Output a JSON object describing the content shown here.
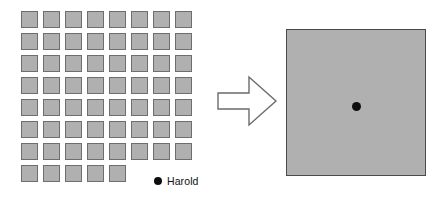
{
  "figure": {
    "background_color": "#ffffff"
  },
  "left_panel": {
    "name": "individual-cells-grid",
    "description": "Grid of individual gray unit squares representing separate records",
    "columns": 8,
    "rows": 8,
    "cell_count": 61,
    "last_row_cell_count": 5,
    "cell_fill_color": "#b0b0b0",
    "cell_border_color": "#6e6e6e",
    "cell_size_px": 17,
    "cell_gap_px": 5
  },
  "legend": {
    "name": "harold-legend",
    "marker": "filled-circle",
    "marker_color": "#0d0d0d",
    "label": "Harold"
  },
  "arrow": {
    "name": "transformation-arrow",
    "direction": "right",
    "style": "outlined-block-arrow",
    "stroke_color": "#6b6b6b",
    "fill_color": "#ffffff"
  },
  "right_panel": {
    "name": "aggregated-area",
    "description": "Single large gray square representing the aggregated area",
    "fill_color": "#b0b0b0",
    "border_color": "#4a4a4a",
    "marker": {
      "name": "harold-point",
      "color": "#0d0d0d",
      "label": "Harold"
    }
  },
  "chart_data": {
    "type": "diagram",
    "left": {
      "label": "Individual cells",
      "cell_count": 61,
      "grid_columns": 8,
      "grid_rows": 8,
      "last_row_cells": 5,
      "highlighted_entity": "Harold"
    },
    "operator": "right-arrow",
    "right": {
      "label": "Aggregated area",
      "cell_count": 1,
      "contains_point": "Harold"
    }
  }
}
